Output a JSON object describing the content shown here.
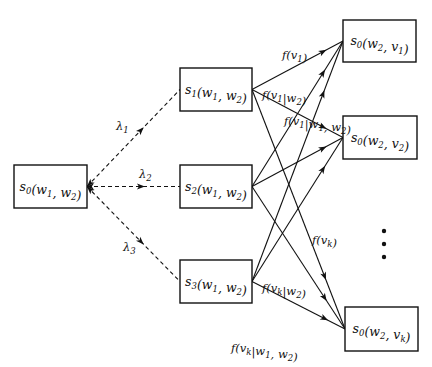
{
  "diagram": {
    "root": {
      "id": "root",
      "label": "s0(w1, w2)",
      "main": "s",
      "sub": "0",
      "args": "(w",
      "a1": "1",
      "mid": ", w",
      "a2": "2",
      "end": ")",
      "x": 14,
      "y": 165,
      "w": 73,
      "h": 43
    },
    "middle": [
      {
        "id": "s1",
        "label": "s1(w1, w2)",
        "main": "s",
        "sub": "1",
        "x": 180,
        "y": 68,
        "w": 72,
        "h": 43
      },
      {
        "id": "s2",
        "label": "s2(w1, w2)",
        "main": "s",
        "sub": "2",
        "x": 180,
        "y": 165,
        "w": 72,
        "h": 43
      },
      {
        "id": "s3",
        "label": "s3(w1, w2)",
        "main": "s",
        "sub": "3",
        "x": 180,
        "y": 260,
        "w": 72,
        "h": 43
      }
    ],
    "right": [
      {
        "id": "t1",
        "label": "s0(w2, v1)",
        "vsub": "1",
        "x": 343,
        "y": 20,
        "w": 73,
        "h": 42
      },
      {
        "id": "t2",
        "label": "s0(w2, v2)",
        "vsub": "2",
        "x": 343,
        "y": 116,
        "w": 74,
        "h": 43
      },
      {
        "id": "tk",
        "label": "s0(w2, vk)",
        "vsub": "k",
        "x": 345,
        "y": 307,
        "w": 73,
        "h": 44
      }
    ],
    "dashed_edges": [
      {
        "from": "root",
        "to": "s1",
        "label": "λ1",
        "sym": "λ",
        "sub": "1",
        "lx": 116,
        "ly": 130
      },
      {
        "from": "root",
        "to": "s2",
        "label": "λ2",
        "sym": "λ",
        "sub": "2",
        "lx": 139,
        "ly": 178
      },
      {
        "from": "root",
        "to": "s3",
        "label": "λ3",
        "sym": "λ",
        "sub": "3",
        "lx": 123,
        "ly": 251
      }
    ],
    "solid_edges": [
      {
        "from": "s1",
        "to": "t1",
        "label": "f(v1)"
      },
      {
        "from": "s1",
        "to": "t2",
        "label": ""
      },
      {
        "from": "s1",
        "to": "tk",
        "label": "f(vk)"
      },
      {
        "from": "s2",
        "to": "t1",
        "label": "f(v1|w2)"
      },
      {
        "from": "s2",
        "to": "t2",
        "label": ""
      },
      {
        "from": "s2",
        "to": "tk",
        "label": "f(vk|w2)"
      },
      {
        "from": "s3",
        "to": "t1",
        "label": "f(v1|w1, w2)"
      },
      {
        "from": "s3",
        "to": "t2",
        "label": ""
      },
      {
        "from": "s3",
        "to": "tk",
        "label": "f(vk|w1, w2)"
      }
    ],
    "edge_labels": {
      "f_v1": "f(v1)",
      "f_v1_w2": "f(v1|w2)",
      "f_v1_w1w2": "f(v1|w1, w2)",
      "f_vk": "f(vk)",
      "f_vk_w2": "f(vk|w2)",
      "f_vk_w1w2": "f(vk|w1, w2)"
    },
    "ellipsis": {
      "symbol": "⋮",
      "x": 384,
      "ys": [
        231,
        244,
        257
      ]
    }
  }
}
